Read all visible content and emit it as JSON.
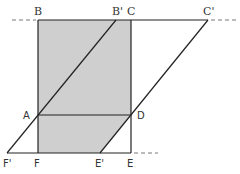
{
  "diagram": {
    "type": "geometry",
    "colors": {
      "stroke": "#222222",
      "shade": "#cfcfcf",
      "background": "#ffffff"
    },
    "points": {
      "B": {
        "label": "B",
        "x": 38,
        "y": 20
      },
      "B_prime": {
        "label": "B'",
        "x": 116,
        "y": 20
      },
      "C": {
        "label": "C",
        "x": 131,
        "y": 20
      },
      "C_prime": {
        "label": "C'",
        "x": 208,
        "y": 20
      },
      "A": {
        "label": "A",
        "x": 38,
        "y": 115
      },
      "D": {
        "label": "D",
        "x": 131,
        "y": 115
      },
      "F_prime": {
        "label": "F'",
        "x": 7,
        "y": 153
      },
      "F": {
        "label": "F",
        "x": 38,
        "y": 153
      },
      "E_prime": {
        "label": "E'",
        "x": 100,
        "y": 153
      },
      "E": {
        "label": "E",
        "x": 131,
        "y": 153
      }
    },
    "labels": {
      "B": "B",
      "B_prime": "B'",
      "C": "C",
      "C_prime": "C'",
      "A": "A",
      "D": "D",
      "F_prime": "F'",
      "F": "F",
      "E_prime": "E'",
      "E": "E"
    }
  }
}
